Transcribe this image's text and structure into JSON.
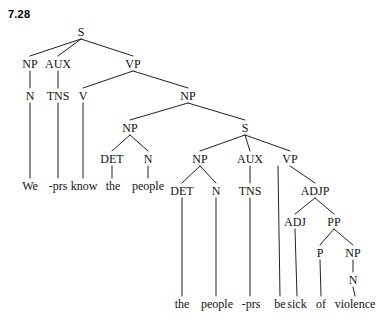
{
  "figure": {
    "number": "7.28"
  },
  "diagram": {
    "type": "syntax-tree",
    "sentence_top": "We -prs know the people",
    "sentence_bottom": "the people -prs be sick of violence",
    "full_sentence": "We -prs know the people the people -prs be sick of violence",
    "line_color": "#222222",
    "text_color": "#111111",
    "background": "#ffffff",
    "nodes": [
      {
        "id": "S1",
        "label": "S",
        "x": 81,
        "y": 36
      },
      {
        "id": "NP1",
        "label": "NP",
        "x": 30,
        "y": 68
      },
      {
        "id": "AUX1",
        "label": "AUX",
        "x": 58,
        "y": 68
      },
      {
        "id": "VP1",
        "label": "VP",
        "x": 133,
        "y": 68
      },
      {
        "id": "N1",
        "label": "N",
        "x": 30,
        "y": 100
      },
      {
        "id": "TNS1",
        "label": "TNS",
        "x": 58,
        "y": 100
      },
      {
        "id": "V1",
        "label": "V",
        "x": 83,
        "y": 100
      },
      {
        "id": "NP2",
        "label": "NP",
        "x": 188,
        "y": 100
      },
      {
        "id": "NP3",
        "label": "NP",
        "x": 130,
        "y": 132
      },
      {
        "id": "S2",
        "label": "S",
        "x": 245,
        "y": 132
      },
      {
        "id": "DET1",
        "label": "DET",
        "x": 112,
        "y": 163
      },
      {
        "id": "N2",
        "label": "N",
        "x": 148,
        "y": 163
      },
      {
        "id": "NP4",
        "label": "NP",
        "x": 200,
        "y": 163
      },
      {
        "id": "AUX2",
        "label": "AUX",
        "x": 250,
        "y": 163
      },
      {
        "id": "VP2",
        "label": "VP",
        "x": 290,
        "y": 163
      },
      {
        "id": "DET2",
        "label": "DET",
        "x": 182,
        "y": 195
      },
      {
        "id": "N3",
        "label": "N",
        "x": 216,
        "y": 195
      },
      {
        "id": "TNS2",
        "label": "TNS",
        "x": 250,
        "y": 195
      },
      {
        "id": "ADJP1",
        "label": "ADJP",
        "x": 315,
        "y": 195
      },
      {
        "id": "ADJ1",
        "label": "ADJ",
        "x": 295,
        "y": 226
      },
      {
        "id": "PP1",
        "label": "PP",
        "x": 334,
        "y": 226
      },
      {
        "id": "P1",
        "label": "P",
        "x": 320,
        "y": 257
      },
      {
        "id": "NP5",
        "label": "NP",
        "x": 353,
        "y": 257
      },
      {
        "id": "N4",
        "label": "N",
        "x": 353,
        "y": 284
      }
    ],
    "leaves": [
      {
        "id": "L1",
        "label": "We",
        "x": 30,
        "y": 190,
        "parent": "N1"
      },
      {
        "id": "L2",
        "label": "-prs",
        "x": 58,
        "y": 190,
        "parent": "TNS1"
      },
      {
        "id": "L3",
        "label": "know",
        "x": 84,
        "y": 190,
        "parent": "V1"
      },
      {
        "id": "L4",
        "label": "the",
        "x": 113,
        "y": 190,
        "parent": "DET1"
      },
      {
        "id": "L5",
        "label": "people",
        "x": 148,
        "y": 190,
        "parent": "N2"
      },
      {
        "id": "L6",
        "label": "the",
        "x": 182,
        "y": 308,
        "parent": "DET2"
      },
      {
        "id": "L7",
        "label": "people",
        "x": 217,
        "y": 308,
        "parent": "N3"
      },
      {
        "id": "L8",
        "label": "-prs",
        "x": 251,
        "y": 308,
        "parent": "TNS2"
      },
      {
        "id": "L9",
        "label": "be",
        "x": 280,
        "y": 308,
        "parent": "VP2"
      },
      {
        "id": "L10",
        "label": "sick",
        "x": 297,
        "y": 308,
        "parent": "ADJ1"
      },
      {
        "id": "L11",
        "label": "of",
        "x": 321,
        "y": 308,
        "parent": "P1"
      },
      {
        "id": "L12",
        "label": "violence",
        "x": 355,
        "y": 308,
        "parent": "N4"
      }
    ],
    "edges": [
      {
        "from": "S1",
        "to": "NP1"
      },
      {
        "from": "S1",
        "to": "AUX1"
      },
      {
        "from": "S1",
        "to": "VP1"
      },
      {
        "from": "NP1",
        "to": "N1"
      },
      {
        "from": "AUX1",
        "to": "TNS1"
      },
      {
        "from": "VP1",
        "to": "V1"
      },
      {
        "from": "VP1",
        "to": "NP2"
      },
      {
        "from": "NP2",
        "to": "NP3"
      },
      {
        "from": "NP2",
        "to": "S2"
      },
      {
        "from": "NP3",
        "to": "DET1"
      },
      {
        "from": "NP3",
        "to": "N2"
      },
      {
        "from": "S2",
        "to": "NP4"
      },
      {
        "from": "S2",
        "to": "AUX2"
      },
      {
        "from": "S2",
        "to": "VP2"
      },
      {
        "from": "NP4",
        "to": "DET2"
      },
      {
        "from": "NP4",
        "to": "N3"
      },
      {
        "from": "AUX2",
        "to": "TNS2"
      },
      {
        "from": "VP2",
        "to": "ADJP1"
      },
      {
        "from": "ADJP1",
        "to": "ADJ1"
      },
      {
        "from": "ADJP1",
        "to": "PP1"
      },
      {
        "from": "PP1",
        "to": "P1"
      },
      {
        "from": "PP1",
        "to": "NP5"
      },
      {
        "from": "NP5",
        "to": "N4"
      }
    ],
    "leaf_edges": [
      {
        "from": "N1",
        "to": "L1",
        "from_x": 30,
        "to_x": 30
      },
      {
        "from": "TNS1",
        "to": "L2",
        "from_x": 58,
        "to_x": 58
      },
      {
        "from": "V1",
        "to": "L3",
        "from_x": 83,
        "to_x": 83
      },
      {
        "from": "DET1",
        "to": "L4",
        "from_x": 112,
        "to_x": 112
      },
      {
        "from": "N2",
        "to": "L5",
        "from_x": 148,
        "to_x": 148
      },
      {
        "from": "DET2",
        "to": "L6",
        "from_x": 182,
        "to_x": 182
      },
      {
        "from": "N3",
        "to": "L7",
        "from_x": 216,
        "to_x": 216
      },
      {
        "from": "TNS2",
        "to": "L8",
        "from_x": 250,
        "to_x": 250
      },
      {
        "from": "VP2",
        "to": "L9",
        "from_x": 278,
        "to_x": 280
      },
      {
        "from": "ADJ1",
        "to": "L10",
        "from_x": 295,
        "to_x": 297
      },
      {
        "from": "P1",
        "to": "L11",
        "from_x": 320,
        "to_x": 321
      },
      {
        "from": "N4",
        "to": "L12",
        "from_x": 353,
        "to_x": 355
      }
    ]
  }
}
